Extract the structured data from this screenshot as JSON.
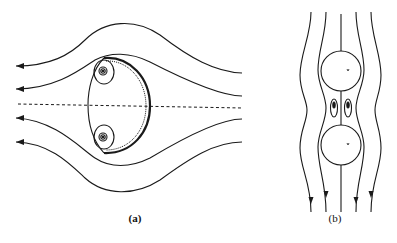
{
  "figure": {
    "panels": [
      {
        "id": "a",
        "label": "(a)",
        "description": "Streamlines past a spherical-cap bubble with a pair of trailing wake vortices; flow from right to left; dashed symmetry axis",
        "streamline_count": 4,
        "wake_vortex_count": 2,
        "flow_direction": "right-to-left"
      },
      {
        "id": "b",
        "label": "(b)",
        "description": "Streamlines past two vertically aligned spheres with a pair of small recirculating eddies in the gap; flow downward",
        "streamline_count": 5,
        "sphere_count": 2,
        "eddy_count": 2,
        "flow_direction": "top-to-bottom"
      }
    ],
    "colors": {
      "line": "#1a1a1a",
      "background": "#ffffff"
    }
  }
}
